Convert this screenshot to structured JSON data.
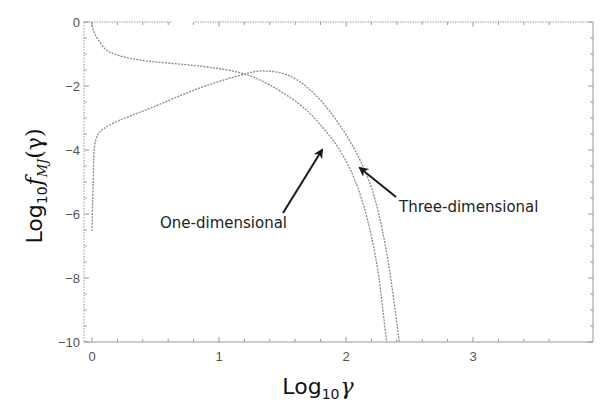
{
  "chart_data": {
    "type": "line",
    "title": "",
    "xlabel": "Log10 γ",
    "ylabel": "Log10 f_MJ(γ)",
    "xlim": [
      -0.06,
      3.94
    ],
    "ylim": [
      -10,
      0
    ],
    "x_ticks": [
      0,
      1,
      2,
      3
    ],
    "y_ticks": [
      0,
      -2,
      -4,
      -6,
      -8,
      -10
    ],
    "x_tick_labels": [
      "0",
      "1",
      "2",
      "3"
    ],
    "y_tick_labels": [
      "0",
      "-2",
      "-4",
      "-6",
      "-8",
      "-10"
    ],
    "grid": false,
    "legend": null,
    "series": [
      {
        "name": "One-dimensional",
        "x": [
          0.0,
          0.01,
          0.05,
          0.14,
          0.38,
          0.85,
          1.17,
          1.4,
          1.64,
          1.8,
          1.95,
          2.07,
          2.17,
          2.25,
          2.32
        ],
        "y": [
          0.0,
          -0.25,
          -0.56,
          -0.94,
          -1.19,
          -1.38,
          -1.59,
          -1.97,
          -2.59,
          -3.22,
          -4.0,
          -4.94,
          -6.19,
          -7.75,
          -10.0
        ]
      },
      {
        "name": "Three-dimensional",
        "x": [
          0.0,
          0.01,
          0.03,
          0.14,
          0.46,
          0.85,
          1.17,
          1.35,
          1.56,
          1.76,
          1.95,
          2.11,
          2.23,
          2.33,
          2.42
        ],
        "y": [
          -6.53,
          -4.94,
          -3.69,
          -3.22,
          -2.69,
          -2.06,
          -1.66,
          -1.53,
          -1.69,
          -2.28,
          -3.22,
          -4.31,
          -5.56,
          -7.44,
          -10.0
        ]
      }
    ],
    "annotations": [
      {
        "text": "One-dimensional",
        "arrow_to": [
          1.82,
          -3.9
        ]
      },
      {
        "text": "Three-dimensional",
        "arrow_to": [
          2.1,
          -4.5
        ]
      }
    ]
  },
  "labels": {
    "x_axis_base": "Log",
    "x_axis_sub": "10",
    "x_axis_symbol": "γ",
    "y_axis_base": "Log",
    "y_axis_sub": "10",
    "y_axis_f": "f",
    "y_axis_fsub": "MJ",
    "y_axis_arg": "(γ)",
    "annot_1d": "One-dimensional",
    "annot_3d": "Three-dimensional"
  },
  "style": {
    "curve_color": "#8a8a8a",
    "frame_color": "#999999",
    "arrow_color": "#1a1a1a"
  }
}
